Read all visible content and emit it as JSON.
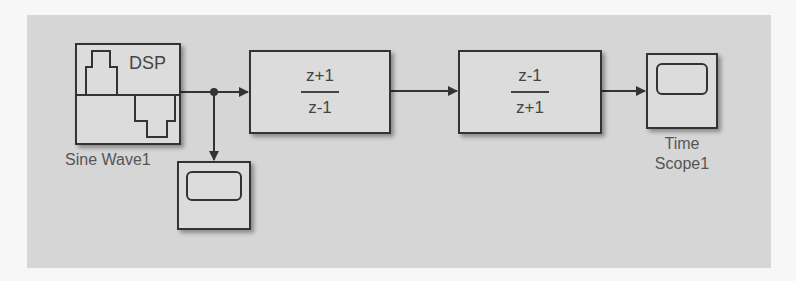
{
  "diagram": {
    "canvas_color": "#d6d6d6",
    "line_color": "#333333",
    "blocks": [
      {
        "id": "sine-wave",
        "type": "DSP Sine Wave source",
        "icon_text": "DSP",
        "label": "Sine Wave1"
      },
      {
        "id": "tf1",
        "type": "Discrete Transfer Function",
        "numerator": "z+1",
        "denominator": "z-1"
      },
      {
        "id": "tf2",
        "type": "Discrete Transfer Function",
        "numerator": "z-1",
        "denominator": "z+1"
      },
      {
        "id": "time-scope-1",
        "type": "Time Scope",
        "label_line1": "Time",
        "label_line2": "Scope1"
      },
      {
        "id": "time-scope-unlabeled",
        "type": "Time Scope",
        "label": ""
      }
    ],
    "connections": [
      {
        "from": "sine-wave",
        "to": "tf1",
        "via": "branch-junction"
      },
      {
        "from": "branch-junction",
        "to": "time-scope-unlabeled"
      },
      {
        "from": "tf1",
        "to": "tf2"
      },
      {
        "from": "tf2",
        "to": "time-scope-1"
      }
    ]
  }
}
